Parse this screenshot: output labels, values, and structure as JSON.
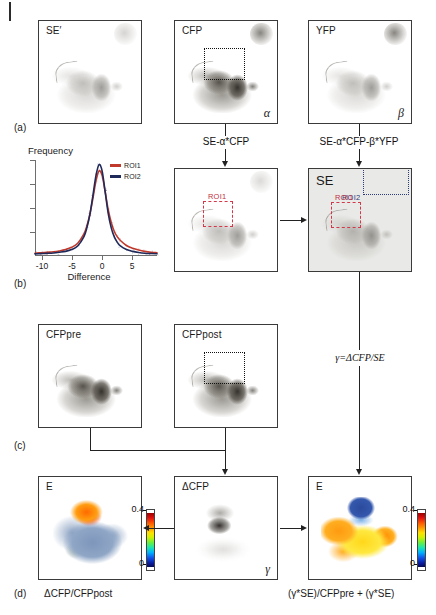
{
  "figure": {
    "parts": {
      "a": "(a)",
      "b": "(b)",
      "c": "(c)",
      "d": "(d)"
    }
  },
  "row_a": {
    "panels": [
      {
        "label": "SE′",
        "greek": ""
      },
      {
        "label": "CFP",
        "greek": "α"
      },
      {
        "label": "YFP",
        "greek": "β"
      }
    ],
    "equations": [
      "SE-α*CFP",
      "SE-α*CFP-β*YFP"
    ]
  },
  "chart_data": {
    "type": "line",
    "title": "",
    "xlabel": "Difference",
    "ylabel": "Frequency",
    "xlim": [
      -11,
      9
    ],
    "ylim": [
      0,
      1.05
    ],
    "xticks": [
      -10,
      -5,
      0,
      5
    ],
    "yticks": [],
    "grid": false,
    "legend_position": "top-right",
    "series": [
      {
        "name": "ROI1",
        "color": "#c0392b",
        "x": [
          -11,
          -10,
          -9,
          -8,
          -7,
          -6,
          -5,
          -4,
          -3,
          -2.5,
          -2,
          -1.5,
          -1,
          -0.5,
          0,
          0.5,
          1,
          1.5,
          2,
          2.5,
          3,
          4,
          5,
          6,
          7,
          8,
          9
        ],
        "y": [
          0.02,
          0.025,
          0.03,
          0.035,
          0.045,
          0.06,
          0.085,
          0.13,
          0.23,
          0.32,
          0.45,
          0.63,
          0.82,
          0.93,
          0.88,
          0.7,
          0.5,
          0.36,
          0.26,
          0.2,
          0.16,
          0.105,
          0.075,
          0.055,
          0.04,
          0.03,
          0.025
        ]
      },
      {
        "name": "ROI2",
        "color": "#1f2a5a",
        "x": [
          -11,
          -10,
          -9,
          -8,
          -7,
          -6,
          -5,
          -4,
          -3,
          -2.5,
          -2,
          -1.5,
          -1,
          -0.5,
          0,
          0.5,
          1,
          1.5,
          2,
          2.5,
          3,
          4,
          5,
          6,
          7,
          8,
          9
        ],
        "y": [
          0.012,
          0.015,
          0.018,
          0.022,
          0.03,
          0.04,
          0.06,
          0.1,
          0.2,
          0.3,
          0.45,
          0.66,
          0.88,
          1.0,
          0.93,
          0.7,
          0.46,
          0.3,
          0.2,
          0.14,
          0.1,
          0.06,
          0.04,
          0.028,
          0.02,
          0.016,
          0.013
        ]
      }
    ]
  },
  "row_b": {
    "middle_panel": {
      "label": "",
      "roi1_tag": "ROI1"
    },
    "se_panel": {
      "label": "SE",
      "roi1_tag": "ROI1",
      "roi2_tag": "ROI2"
    }
  },
  "row_c": {
    "panels": [
      {
        "label": "CFPpre"
      },
      {
        "label": "CFPpost"
      }
    ]
  },
  "gamma_equation": "γ=ΔCFP/SE",
  "row_d": {
    "panels": [
      {
        "label": "E",
        "greek": ""
      },
      {
        "label": "ΔCFP",
        "greek": "γ"
      },
      {
        "label": "E",
        "greek": ""
      }
    ],
    "colorbars": [
      {
        "max": "0.4",
        "min": "0"
      },
      {
        "max": "0.4",
        "min": "0"
      }
    ],
    "captions": [
      "ΔCFP/CFPpost",
      "(γ*SE)/CFPpre + (γ*SE)"
    ]
  },
  "colors": {
    "roi1": "#c0392b",
    "roi2": "#1f2a5a",
    "panel_border": "#3a3a3a",
    "arrow": "#222222",
    "se_background": "#e9e9e7"
  }
}
